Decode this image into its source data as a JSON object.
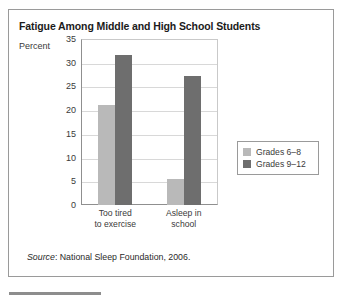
{
  "figure": {
    "title": "Fatigue Among Middle and High School Students",
    "axis_caption": "Percent",
    "source_label": "Source",
    "source_separator": ": ",
    "source_text": "National Sleep Foundation, 2006."
  },
  "legend": {
    "position": "right",
    "entries": [
      {
        "label": "Grades 6–8",
        "color": "#b9b9b9"
      },
      {
        "label": "Grades 9–12",
        "color": "#6e6e6e"
      }
    ]
  },
  "chart_data": {
    "type": "bar",
    "title": "Fatigue Among Middle and High School Students",
    "subtitle": "",
    "xlabel": "",
    "ylabel": "Percent",
    "ylim": [
      0,
      35
    ],
    "yticks": [
      0,
      5,
      10,
      15,
      20,
      25,
      30,
      35
    ],
    "ytick_labels": [
      "0",
      "5",
      "10",
      "15",
      "20",
      "25",
      "30",
      "35"
    ],
    "grid": true,
    "grid_axis": "y",
    "categories": [
      "Too tired to exercise",
      "Asleep in school"
    ],
    "category_lines": [
      [
        "Too tired",
        "to exercise"
      ],
      [
        "Asleep in",
        "school"
      ]
    ],
    "series": [
      {
        "name": "Grades 6–8",
        "color": "#b9b9b9",
        "values": [
          21,
          5.5
        ]
      },
      {
        "name": "Grades 9–12",
        "color": "#6e6e6e",
        "values": [
          31.7,
          27.3
        ]
      }
    ],
    "annotations": [],
    "source": "Source: National Sleep Foundation, 2006."
  }
}
